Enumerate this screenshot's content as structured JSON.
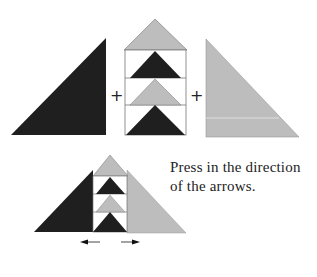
{
  "colors": {
    "dark": "#1f1f1f",
    "light": "#bdbdbd",
    "line": "#555555",
    "background": "#ffffff"
  },
  "top_row": {
    "operators": [
      "+",
      "+"
    ],
    "pieces": [
      "dark-half-triangle",
      "flying-geese-column",
      "light-half-triangle"
    ]
  },
  "caption": {
    "line1": "Press in the direction",
    "line2": "of the arrows."
  },
  "arrows": {
    "left": "left-arrow",
    "right": "right-arrow"
  }
}
